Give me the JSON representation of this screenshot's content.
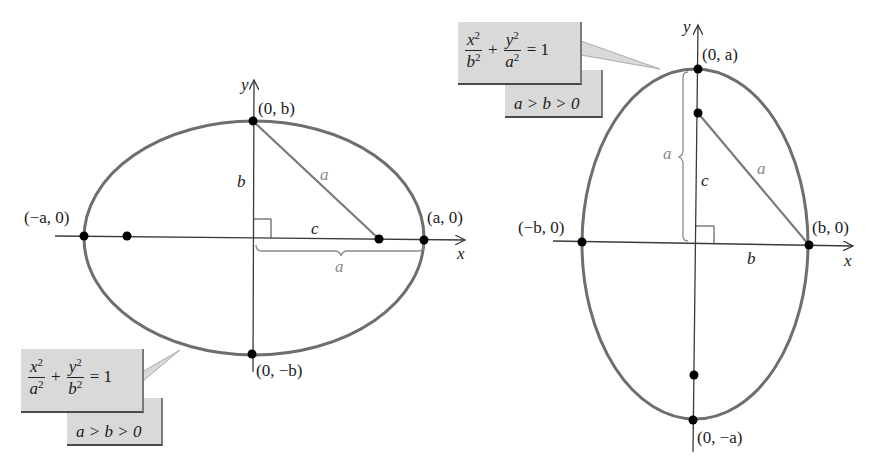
{
  "figure": {
    "left_ellipse": {
      "orientation": "horizontal major axis",
      "equation": {
        "x_num": "x",
        "x_den": "a",
        "y_num": "y",
        "y_den": "b",
        "exp": "2",
        "plus": "+",
        "equals": "= 1"
      },
      "condition": "a > b > 0",
      "labels": {
        "top_vertex": "(0, b)",
        "bottom_vertex": "(0, −b)",
        "left_vertex": "(−a, 0)",
        "right_vertex": "(a, 0)",
        "x_axis": "x",
        "y_axis": "y",
        "segment_b": "b",
        "segment_c": "c",
        "hypotenuse_a": "a",
        "brace_a": "a"
      }
    },
    "right_ellipse": {
      "orientation": "vertical major axis",
      "equation": {
        "x_num": "x",
        "x_den": "b",
        "y_num": "y",
        "y_den": "a",
        "exp": "2",
        "plus": "+",
        "equals": "= 1"
      },
      "condition": "a > b > 0",
      "labels": {
        "top_vertex": "(0, a)",
        "bottom_vertex": "(0, −a)",
        "left_vertex": "(−b, 0)",
        "right_vertex": "(b, 0)",
        "x_axis": "x",
        "y_axis": "y",
        "segment_b": "b",
        "segment_c": "c",
        "hypotenuse_a": "a",
        "brace_a": "a"
      }
    },
    "colors": {
      "curve": "#6e6e6e",
      "axis": "#3a3a3a",
      "point": "#000000",
      "callout_bg": "#d9d9d9",
      "gray_label": "#8a8a8a"
    }
  }
}
